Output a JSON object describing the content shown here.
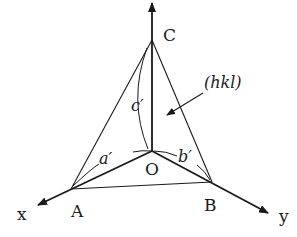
{
  "diagram": {
    "points": {
      "C": {
        "label": "C"
      },
      "O": {
        "label": "O"
      },
      "A": {
        "label": "A"
      },
      "B": {
        "label": "B"
      }
    },
    "axes": {
      "x": {
        "label": "x"
      },
      "y": {
        "label": "y"
      }
    },
    "intercepts": {
      "a": {
        "label": "a′"
      },
      "b": {
        "label": "b′"
      },
      "c": {
        "label": "c′"
      }
    },
    "plane": {
      "label": "(hkl)"
    },
    "colors": {
      "stroke": "#1a1a1a",
      "background": "#ffffff"
    }
  }
}
